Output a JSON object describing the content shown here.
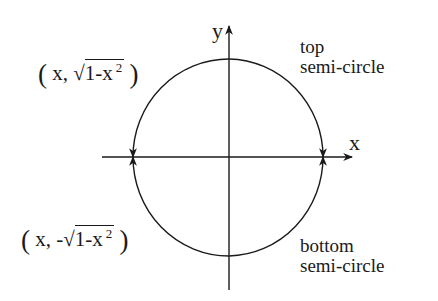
{
  "diagram": {
    "type": "unit-circle-semicircles",
    "axes": {
      "x_label": "x",
      "y_label": "y"
    },
    "labels": {
      "top_point": {
        "open": "(",
        "x": "x,",
        "sign": "",
        "sqrt_symbol": "√",
        "radicand": "1-x",
        "exponent": "2",
        "close": ")"
      },
      "bottom_point": {
        "open": "(",
        "x": "x,",
        "sign": "-",
        "sqrt_symbol": "√",
        "radicand": "1-x",
        "exponent": "2",
        "close": ")"
      },
      "top_curve": [
        "top",
        "semi-circle"
      ],
      "bottom_curve": [
        "bottom",
        "semi-circle"
      ]
    },
    "colors": {
      "stroke": "#1a1a1a",
      "background": "#ffffff"
    }
  }
}
